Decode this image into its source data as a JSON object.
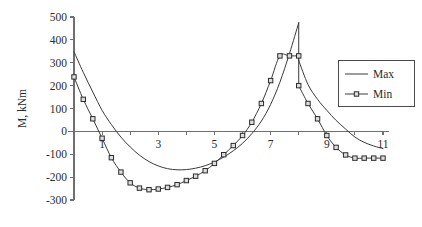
{
  "chart_data": {
    "type": "line",
    "title": "",
    "xlabel": "",
    "ylabel": "M, kNm",
    "xlim": [
      0,
      11
    ],
    "ylim": [
      -300,
      500
    ],
    "grid": false,
    "legend_position": "right",
    "x_ticks": [
      0,
      1,
      2,
      3,
      4,
      5,
      6,
      7,
      8,
      9,
      10,
      11
    ],
    "x_tick_labels": [
      "",
      "1",
      "",
      "3",
      "",
      "5",
      "",
      "7",
      "",
      "9",
      "",
      "11"
    ],
    "y_ticks": [
      -300,
      -200,
      -100,
      0,
      100,
      200,
      300,
      400,
      500
    ],
    "y_tick_labels": [
      "-300",
      "-200",
      "-100",
      "0",
      "100",
      "200",
      "300",
      "400",
      "500"
    ],
    "series": [
      {
        "name": "Max",
        "marker": "none",
        "x": [
          0,
          0.33,
          0.67,
          1.0,
          1.33,
          1.67,
          2.0,
          2.33,
          2.67,
          3.0,
          3.33,
          3.67,
          4.0,
          4.33,
          4.67,
          5.0,
          5.33,
          5.67,
          6.0,
          6.33,
          6.67,
          7.0,
          7.33,
          7.67,
          8.0,
          8.0,
          8.33,
          8.67,
          9.0,
          9.33,
          9.67,
          10.0,
          10.33,
          10.67,
          11.0
        ],
        "values": [
          348,
          258,
          172,
          92,
          30,
          -25,
          -68,
          -104,
          -132,
          -151,
          -163,
          -168,
          -167,
          -161,
          -150,
          -134,
          -112,
          -85,
          -52,
          -10,
          45,
          118,
          215,
          340,
          475,
          310,
          205,
          140,
          92,
          48,
          10,
          -25,
          -48,
          -64,
          -75
        ]
      },
      {
        "name": "Min",
        "marker": "square",
        "x": [
          0,
          0.33,
          0.67,
          1.0,
          1.33,
          1.67,
          2.0,
          2.33,
          2.67,
          3.0,
          3.33,
          3.67,
          4.0,
          4.33,
          4.67,
          5.0,
          5.33,
          5.67,
          6.0,
          6.33,
          6.67,
          7.0,
          7.33,
          7.67,
          8.0,
          8.0,
          8.33,
          8.67,
          9.0,
          9.33,
          9.67,
          10.0,
          10.33,
          10.67,
          11.0
        ],
        "values": [
          238,
          140,
          55,
          -30,
          -115,
          -178,
          -225,
          -248,
          -255,
          -252,
          -245,
          -233,
          -215,
          -196,
          -172,
          -140,
          -102,
          -62,
          -18,
          40,
          122,
          222,
          330,
          330,
          330,
          200,
          122,
          55,
          -18,
          -70,
          -103,
          -117,
          -117,
          -117,
          -117
        ]
      }
    ]
  },
  "legend": {
    "items": [
      {
        "label": "Max",
        "marker": "none"
      },
      {
        "label": "Min",
        "marker": "square"
      }
    ]
  }
}
